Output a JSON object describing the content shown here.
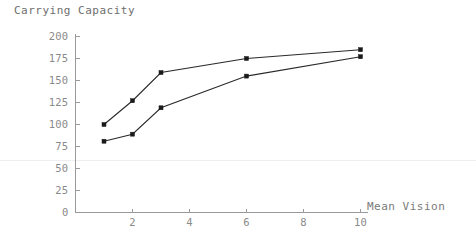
{
  "chart_data": {
    "type": "line",
    "title": "Carrying Capacity",
    "xlabel": "Mean Vision",
    "ylabel": "Carrying Capacity",
    "xlim": [
      0,
      10.6
    ],
    "ylim": [
      0,
      200
    ],
    "xticks": [
      2,
      4,
      6,
      8,
      10
    ],
    "xtick_labels": [
      "2",
      "4",
      "6",
      "8",
      "10"
    ],
    "yticks": [
      0,
      25,
      50,
      75,
      100,
      125,
      150,
      175,
      200
    ],
    "ytick_labels": [
      "0",
      "25",
      "50",
      "75",
      "100",
      "125",
      "150",
      "175",
      "200"
    ],
    "grid": false,
    "legend": "none",
    "marker": "square",
    "line_color": "#2a2a2a",
    "marker_color": "#1a1a1a",
    "axis_color": "#9a9a9a",
    "text_color": "#7a7a7a",
    "background": "#ffffff",
    "series": [
      {
        "name": "upper",
        "x": [
          1,
          2,
          3,
          6,
          10
        ],
        "values": [
          100,
          127,
          159,
          175,
          185
        ]
      },
      {
        "name": "lower",
        "x": [
          1,
          2,
          3,
          6,
          10
        ],
        "values": [
          81,
          89,
          119,
          155,
          177
        ]
      }
    ]
  },
  "figure": {
    "title_text": "Carrying Capacity",
    "xaxis_label_text": "Mean Vision"
  }
}
